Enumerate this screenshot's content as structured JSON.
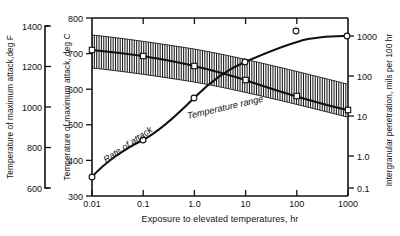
{
  "chart_data": {
    "type": "line",
    "title": "",
    "xlabel": "Exposure to elevated temperatures, hr",
    "xscale": "log",
    "xlim": [
      0.01,
      1000
    ],
    "xticks": [
      "0.01",
      "0.1",
      "1.0",
      "10",
      "100",
      "1000"
    ],
    "xtick_values": [
      0.01,
      0.1,
      1,
      10,
      100,
      1000
    ],
    "axes": {
      "left_outer": {
        "label": "Temperature of maximum attack,deg F",
        "ticks": [
          "600",
          "800",
          "1000",
          "1200",
          "1400"
        ],
        "tick_values": [
          600,
          800,
          1000,
          1200,
          1400
        ],
        "lim": [
          572,
          1472
        ],
        "scale": "linear"
      },
      "left_inner": {
        "label": "Temperature of maximum attack, deg C",
        "ticks": [
          "300",
          "400",
          "500",
          "600",
          "700",
          "800"
        ],
        "tick_values": [
          300,
          400,
          500,
          600,
          700,
          800
        ],
        "lim": [
          300,
          800
        ],
        "scale": "linear"
      },
      "right": {
        "label": "Intergranular penetration, mils per 100 hr",
        "ticks": [
          "0.1",
          "1.0",
          "10",
          "100",
          "1000"
        ],
        "tick_values": [
          0.1,
          1,
          10,
          100,
          1000
        ],
        "lim": [
          0.1,
          1000
        ],
        "scale": "log"
      }
    },
    "grid": false,
    "legend": "none",
    "annotations": [
      {
        "name": "rate-of-attack-label",
        "text": "Rate of attack",
        "x": 0.035,
        "y_right": 1.3,
        "rotation": -34
      },
      {
        "name": "temperature-range-label",
        "text": "Temperature range",
        "x": 1.2,
        "y_left_c": 545,
        "rotation": -13
      }
    ],
    "series": [
      {
        "name": "Rate of attack",
        "axis": "right",
        "marker": "open-circle",
        "x": [
          0.01,
          0.1,
          1.0,
          10,
          100,
          1000
        ],
        "y": [
          0.13,
          1.6,
          13,
          160,
          700,
          900
        ],
        "points_px": [
          [
            92,
            177
          ],
          [
            143,
            140
          ],
          [
            194,
            98
          ],
          [
            245,
            62
          ],
          [
            296,
            40
          ],
          [
            347,
            36
          ]
        ]
      },
      {
        "name": "Temperature range upper",
        "axis": "left_inner",
        "marker": "open-square",
        "x": [
          0.01,
          0.1,
          1.0,
          10,
          100,
          1000
        ],
        "y": [
          748,
          730,
          705,
          672,
          637,
          600
        ],
        "points_px": [
          [
            92,
            35
          ],
          [
            143,
            41
          ],
          [
            194,
            49
          ],
          [
            245,
            60
          ],
          [
            296,
            72
          ],
          [
            347,
            84
          ]
        ]
      },
      {
        "name": "Temperature range lower",
        "axis": "left_inner",
        "marker": "open-square",
        "x": [
          0.01,
          0.1,
          1.0,
          10,
          100,
          1000
        ],
        "y": [
          648,
          630,
          605,
          572,
          537,
          500
        ],
        "points_px": [
          [
            92,
            68
          ],
          [
            143,
            74
          ],
          [
            194,
            82
          ],
          [
            245,
            93
          ],
          [
            296,
            105
          ],
          [
            347,
            117
          ]
        ]
      },
      {
        "name": "Temperature of maximum attack",
        "axis": "left_inner",
        "marker": "open-square",
        "x": [
          0.01,
          0.1,
          1.0,
          10,
          100,
          1000
        ],
        "y": [
          700,
          690,
          660,
          615,
          570,
          535
        ],
        "points_px": [
          [
            92,
            50
          ],
          [
            143,
            56
          ],
          [
            194,
            66
          ],
          [
            245,
            80
          ],
          [
            296,
            96
          ],
          [
            347,
            110
          ]
        ]
      }
    ],
    "band": {
      "name": "Temperature range",
      "style": "vertical-hatch",
      "description": "Hatched band spanning between upper and lower temperature-range boundaries"
    },
    "colors": {
      "ink": "#111111",
      "background": "#ffffff",
      "hatch": "#1a1a1a"
    }
  }
}
